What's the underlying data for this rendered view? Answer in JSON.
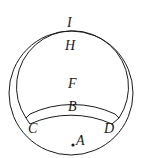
{
  "diagram": {
    "labels": {
      "I": "I",
      "H": "H",
      "F": "F",
      "B": "B",
      "C": "C",
      "D": "D",
      "A": "A"
    },
    "stroke_color": "#1a1a1a"
  }
}
